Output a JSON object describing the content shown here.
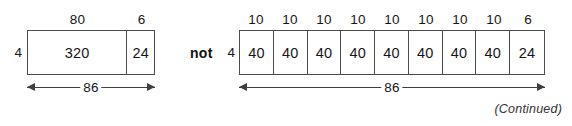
{
  "figure": {
    "connector_word": "not",
    "continued_note": "(Continued)",
    "left_diagram": {
      "height_label": "4",
      "total_label": "86",
      "segment_labels": [
        "80",
        "6"
      ],
      "cell_values": [
        "320",
        "24"
      ],
      "cell_widths": [
        80,
        6
      ]
    },
    "right_diagram": {
      "height_label": "4",
      "total_label": "86",
      "segment_labels": [
        "10",
        "10",
        "10",
        "10",
        "10",
        "10",
        "10",
        "10",
        "6"
      ],
      "cell_values": [
        "40",
        "40",
        "40",
        "40",
        "40",
        "40",
        "40",
        "40",
        "24"
      ],
      "cell_widths": [
        10,
        10,
        10,
        10,
        10,
        10,
        10,
        10,
        6
      ]
    }
  },
  "colors": {
    "stroke": "#4b4b4b",
    "text": "#161616",
    "background": "#ffffff"
  }
}
